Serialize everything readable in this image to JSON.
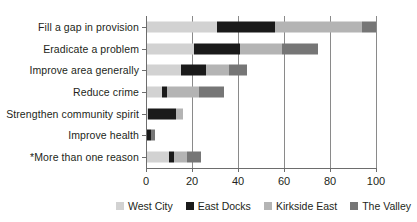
{
  "chart_data": {
    "type": "bar",
    "orientation": "horizontal",
    "stacked": true,
    "title": "",
    "xlabel": "",
    "ylabel": "",
    "xlim": [
      0,
      100
    ],
    "xticks": [
      0,
      20,
      40,
      60,
      80,
      100
    ],
    "xticklabels": [
      "0",
      "20",
      "40",
      "60",
      "80",
      "100"
    ],
    "grid": "vertical",
    "legend_position": "bottom-right",
    "categories": [
      "Fill a gap in provision",
      "Eradicate a problem",
      "Improve area generally",
      "Reduce crime",
      "Strengthen community spirit",
      "Improve health",
      "*More than one reason"
    ],
    "series": [
      {
        "name": "West City",
        "color": "#d2d2d2",
        "values": [
          31,
          21,
          15,
          7,
          1,
          0,
          10
        ]
      },
      {
        "name": "East Docks",
        "color": "#1a1a1a",
        "values": [
          25,
          20,
          11,
          2,
          12,
          2,
          2
        ]
      },
      {
        "name": "Kirkside East",
        "color": "#b4b4b4",
        "values": [
          38,
          18,
          10,
          14,
          3,
          0,
          6
        ]
      },
      {
        "name": "The Valley",
        "color": "#767676",
        "values": [
          6,
          16,
          8,
          11,
          0,
          2,
          6
        ]
      }
    ],
    "totals": [
      100,
      75,
      44,
      34,
      16,
      4,
      24
    ]
  },
  "legend": {
    "items": [
      {
        "label": "West City",
        "color": "#d2d2d2"
      },
      {
        "label": "East Docks",
        "color": "#1a1a1a"
      },
      {
        "label": "Kirkside East",
        "color": "#b4b4b4"
      },
      {
        "label": "The Valley",
        "color": "#767676"
      }
    ]
  }
}
